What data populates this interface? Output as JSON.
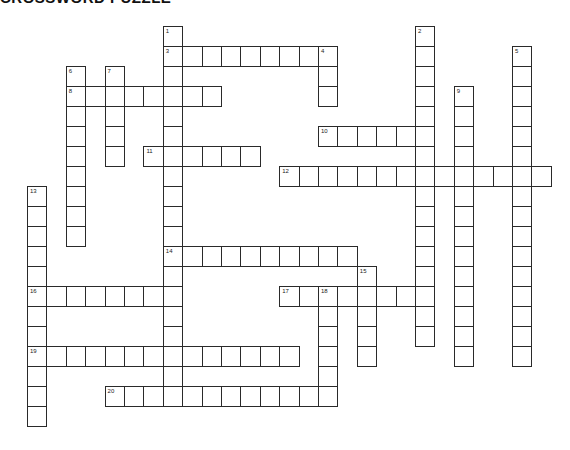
{
  "puzzle": {
    "title": "CROSSWORD PUZZLE",
    "layout": {
      "origin_x": 27,
      "origin_y": 26,
      "cell_w": 19.4,
      "cell_h": 20
    },
    "words": [
      {
        "number": 1,
        "direction": "down",
        "row": 0,
        "col": 7,
        "length": 19
      },
      {
        "number": 2,
        "direction": "down",
        "row": 0,
        "col": 20,
        "length": 16
      },
      {
        "number": 3,
        "direction": "across",
        "row": 1,
        "col": 7,
        "length": 9
      },
      {
        "number": 4,
        "direction": "down",
        "row": 1,
        "col": 15,
        "length": 3
      },
      {
        "number": 5,
        "direction": "down",
        "row": 1,
        "col": 25,
        "length": 16
      },
      {
        "number": 6,
        "direction": "down",
        "row": 2,
        "col": 2,
        "length": 9
      },
      {
        "number": 7,
        "direction": "down",
        "row": 2,
        "col": 4,
        "length": 5
      },
      {
        "number": 8,
        "direction": "across",
        "row": 3,
        "col": 2,
        "length": 8
      },
      {
        "number": 9,
        "direction": "down",
        "row": 3,
        "col": 22,
        "length": 14
      },
      {
        "number": 10,
        "direction": "across",
        "row": 5,
        "col": 15,
        "length": 6
      },
      {
        "number": 11,
        "direction": "across",
        "row": 6,
        "col": 6,
        "length": 6
      },
      {
        "number": 12,
        "direction": "across",
        "row": 7,
        "col": 13,
        "length": 14
      },
      {
        "number": 13,
        "direction": "down",
        "row": 8,
        "col": 0,
        "length": 12
      },
      {
        "number": 14,
        "direction": "across",
        "row": 11,
        "col": 7,
        "length": 10
      },
      {
        "number": 15,
        "direction": "down",
        "row": 12,
        "col": 17,
        "length": 5
      },
      {
        "number": 16,
        "direction": "across",
        "row": 13,
        "col": 0,
        "length": 8
      },
      {
        "number": 17,
        "direction": "across",
        "row": 13,
        "col": 13,
        "length": 8
      },
      {
        "number": 18,
        "direction": "down",
        "row": 13,
        "col": 15,
        "length": 6
      },
      {
        "number": 19,
        "direction": "across",
        "row": 16,
        "col": 0,
        "length": 14
      },
      {
        "number": 20,
        "direction": "across",
        "row": 18,
        "col": 4,
        "length": 12
      }
    ]
  }
}
